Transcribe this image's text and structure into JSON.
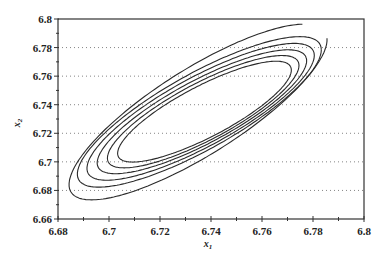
{
  "chart_data": {
    "type": "contour",
    "title": "",
    "xlabel": "x",
    "xlabel_sub": "1",
    "ylabel": "x",
    "ylabel_sub": "2",
    "xlim": [
      6.68,
      6.8
    ],
    "ylim": [
      6.66,
      6.8
    ],
    "xticks": [
      "6.68",
      "6.7",
      "6.72",
      "6.74",
      "6.76",
      "6.78",
      "6.8"
    ],
    "xtick_values": [
      6.68,
      6.7,
      6.72,
      6.74,
      6.76,
      6.78,
      6.8
    ],
    "xminor_values": [
      6.69,
      6.71,
      6.73,
      6.75,
      6.77,
      6.79
    ],
    "yticks": [
      "6.66",
      "6.68",
      "6.7",
      "6.72",
      "6.74",
      "6.76",
      "6.78",
      "6.8"
    ],
    "ytick_values": [
      6.66,
      6.68,
      6.7,
      6.72,
      6.74,
      6.76,
      6.78,
      6.8
    ],
    "yminor_values": [
      6.67,
      6.69,
      6.71,
      6.73,
      6.75,
      6.77,
      6.79
    ],
    "grid": "horizontal-dotted",
    "legend": "none",
    "contours": [
      {
        "level": 1,
        "center": [
          6.7375,
          6.7355
        ],
        "x_extent": [
          6.7035,
          6.7715
        ],
        "y_extent": [
          6.7005,
          6.7705
        ],
        "tilt": 0.82
      },
      {
        "level": 2,
        "center": [
          6.737,
          6.7355
        ],
        "x_extent": [
          6.6995,
          6.7745
        ],
        "y_extent": [
          6.6965,
          6.7745
        ],
        "tilt": 0.82
      },
      {
        "level": 3,
        "center": [
          6.7365,
          6.7355
        ],
        "x_extent": [
          6.6955,
          6.7775
        ],
        "y_extent": [
          6.6925,
          6.7785
        ],
        "tilt": 0.82
      },
      {
        "level": 4,
        "center": [
          6.736,
          6.7355
        ],
        "x_extent": [
          6.6915,
          6.7805
        ],
        "y_extent": [
          6.6875,
          6.7825
        ],
        "tilt": 0.82
      },
      {
        "level": 5,
        "center": [
          6.7355,
          6.7355
        ],
        "x_extent": [
          6.688,
          6.7835
        ],
        "y_extent": [
          6.6825,
          6.787
        ],
        "tilt": 0.82
      },
      {
        "level": 6,
        "center": [
          6.735,
          6.7355
        ],
        "x_extent": [
          6.686,
          6.787
        ],
        "y_extent": [
          6.674,
          6.796
        ],
        "tilt": 0.82,
        "open_at": "top-right"
      }
    ]
  }
}
